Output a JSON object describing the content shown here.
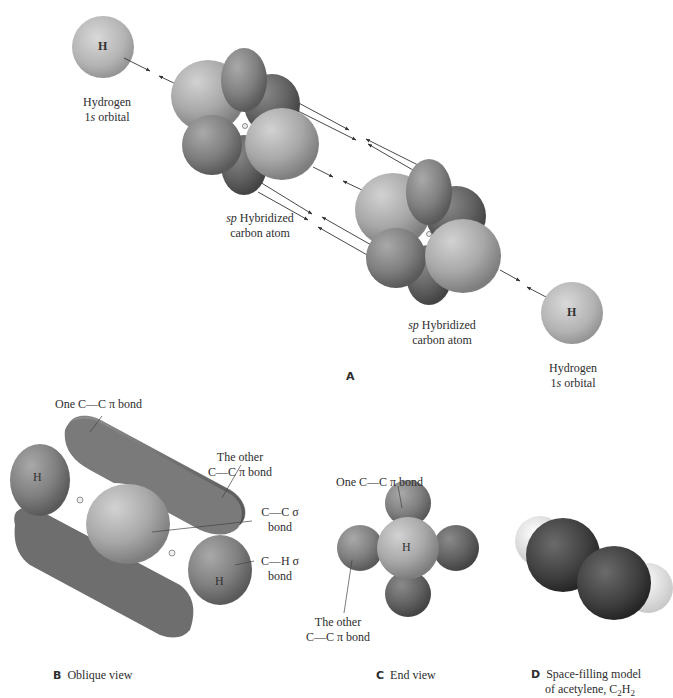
{
  "panel_a": {
    "letter": "A",
    "h_left": {
      "symbol": "H",
      "label_line1": "Hydrogen",
      "label_line2_num": "1",
      "label_line2_ital": "s",
      "label_line2_rest": " orbital"
    },
    "carbon_left": {
      "label_ital": "sp",
      "label_line1_rest": " Hybridized",
      "label_line2": "carbon atom"
    },
    "carbon_right": {
      "label_ital": "sp",
      "label_line1_rest": " Hybridized",
      "label_line2": "carbon atom"
    },
    "h_right": {
      "symbol": "H",
      "label_line1": "Hydrogen",
      "label_line2_num": "1",
      "label_line2_ital": "s",
      "label_line2_rest": " orbital"
    }
  },
  "panel_b": {
    "letter": "B",
    "caption": "Oblique view",
    "h_left": "H",
    "h_right": "H",
    "c_left": "C",
    "c_right": "C",
    "callouts": {
      "one_pi": "One C—C π bond",
      "other_pi_line1": "The other",
      "other_pi_line2": "C—C π bond",
      "cc_sigma_line1": "C—C σ",
      "cc_sigma_line2": "bond",
      "ch_sigma_line1": "C—H σ",
      "ch_sigma_line2": "bond"
    }
  },
  "panel_c": {
    "letter": "C",
    "caption": "End view",
    "center": "H",
    "callouts": {
      "one_pi": "One C—C π bond",
      "other_pi_line1": "The other",
      "other_pi_line2": "C—C π bond"
    }
  },
  "panel_d": {
    "letter": "D",
    "caption_line1": "Space-filling model",
    "caption_line2_prefix": "of acetylene, C",
    "sub1": "2",
    "h": "H",
    "sub2": "2"
  }
}
